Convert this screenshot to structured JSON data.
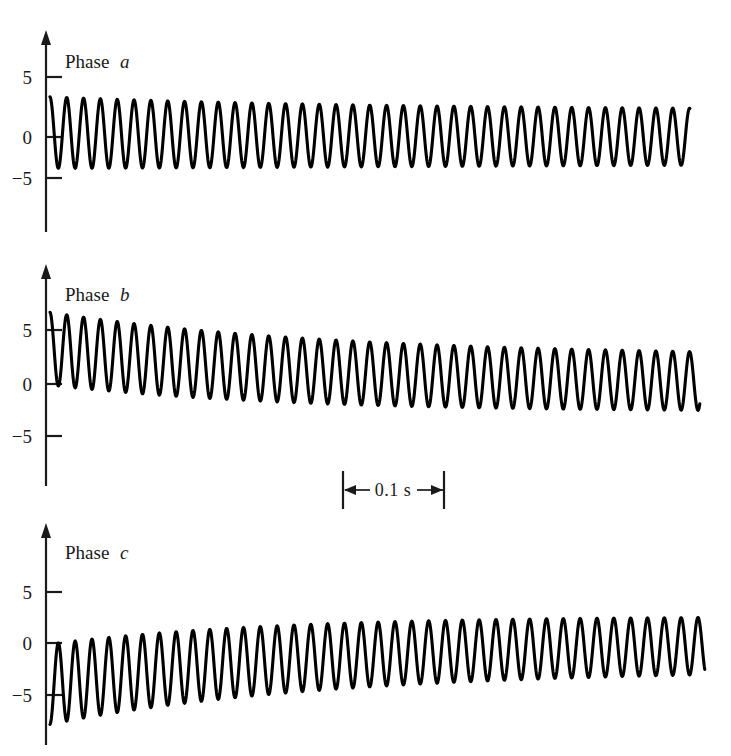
{
  "figure": {
    "name": "three-phase-short-circuit-current-waveforms",
    "background_color": "#ffffff",
    "trace_color": "#000000",
    "axis_color": "#1a1a1a",
    "width": 731,
    "height": 756
  },
  "time_scale": {
    "label": "0.1 s",
    "span_seconds": 0.1,
    "span_pixels": 101,
    "marker_type": "double-headed-arrow-between-end-bars"
  },
  "panels": [
    {
      "id": "phase-a",
      "label_prefix": "Phase",
      "label_italic": "a",
      "label_full": "Phase a",
      "y_ticks": [
        5,
        0,
        -5
      ],
      "y_tick_labels": [
        "5",
        "0",
        "−5"
      ],
      "axis_x_px": 46,
      "zero_y_px": 137,
      "px_per_unit": 9.8,
      "axis_top_px": 32,
      "axis_bottom_px": 232,
      "trace_start_x_px": 50,
      "trace_end_x_px": 690
    },
    {
      "id": "phase-b",
      "label_prefix": "Phase",
      "label_italic": "b",
      "label_full": "Phase b",
      "y_ticks": [
        5,
        0,
        -5
      ],
      "y_tick_labels": [
        "5",
        "0",
        "−5"
      ],
      "axis_x_px": 46,
      "zero_y_px": 384,
      "px_per_unit": 10.4,
      "axis_top_px": 266,
      "axis_bottom_px": 486,
      "trace_start_x_px": 50,
      "trace_end_x_px": 700
    },
    {
      "id": "phase-c",
      "label_prefix": "Phase",
      "label_italic": "c",
      "label_full": "Phase c",
      "y_ticks": [
        5,
        0,
        -5
      ],
      "y_tick_labels": [
        "5",
        "0",
        "−5"
      ],
      "axis_x_px": 46,
      "zero_y_px": 643,
      "px_per_unit": 10.3,
      "axis_top_px": 525,
      "axis_bottom_px": 745,
      "trace_start_x_px": 50,
      "trace_end_x_px": 705
    }
  ],
  "chart_data": {
    "type": "line",
    "title": "",
    "xlabel": "",
    "ylabel": "",
    "xlim": [
      0,
      0.635
    ],
    "ylim": [
      -9,
      9
    ],
    "grid": false,
    "legend": "inline-panel-labels",
    "time_unit": "s",
    "frequency_hz": 60,
    "samples_per_cycle": 64,
    "model": "damped-sinusoid-with-decaying-dc-offset",
    "series": [
      {
        "name": "Phase a",
        "panel": "phase-a",
        "ac_amplitude_initial": 3.65,
        "ac_amplitude_final": 2.7,
        "ac_decay_tau_s": 0.42,
        "dc_offset_initial": 0.45,
        "dc_decay_tau_s": 0.22,
        "phase_deg": 92,
        "peak_max": 4.1,
        "peak_min": -3.3,
        "start_value": 0.0
      },
      {
        "name": "Phase b",
        "panel": "phase-b",
        "ac_amplitude_initial": 3.5,
        "ac_amplitude_final": 2.6,
        "ac_decay_tau_s": 0.45,
        "dc_offset_initial": 3.4,
        "dc_decay_tau_s": 0.26,
        "phase_deg": 92,
        "peak_max": 7.0,
        "peak_min": -1.4,
        "start_value": 0.0
      },
      {
        "name": "Phase c",
        "panel": "phase-c",
        "ac_amplitude_initial": 3.9,
        "ac_amplitude_final": 2.5,
        "ac_decay_tau_s": 0.4,
        "dc_offset_initial": -4.0,
        "dc_decay_tau_s": 0.25,
        "phase_deg": 272,
        "peak_max": 2.6,
        "peak_min": -8.0,
        "start_value": 0.0
      }
    ],
    "annotations": [
      {
        "text": "0.1 s",
        "type": "horizontal-scale-bar",
        "x_center_px": 393,
        "y_px": 490
      },
      {
        "text": "Phase a",
        "type": "panel-label",
        "x_px": 65,
        "y_px": 62
      },
      {
        "text": "Phase b",
        "type": "panel-label",
        "x_px": 65,
        "y_px": 295
      },
      {
        "text": "Phase c",
        "type": "panel-label",
        "x_px": 65,
        "y_px": 553
      }
    ]
  }
}
